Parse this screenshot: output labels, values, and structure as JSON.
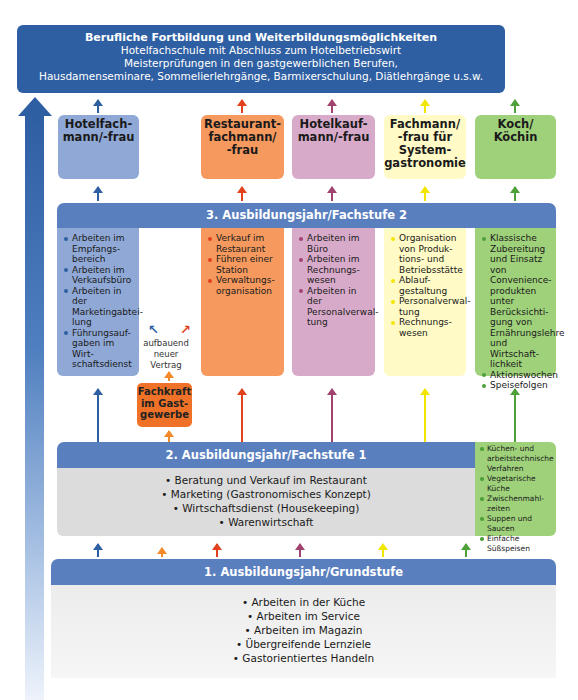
{
  "top_banner": {
    "title": "Berufliche Fortbildung und Weiterbildungsmöglichkeiten",
    "lines": [
      "Hotelfachschule mit Abschluss zum Hotelbetriebswirt",
      "Meisterprüfungen in den gastgewerblichen Berufen,",
      "Hausdamenseminare, Sommelierlehrgänge, Barmixerschulung, Diätlehrgänge u.s.w."
    ]
  },
  "colors": {
    "hotelfach": "#8fa8d6",
    "hotelfach_arrow": "#2f5fa3",
    "restaurant": "#f5995e",
    "restaurant_arrow": "#e2421b",
    "hotelkauf": "#d8aac9",
    "hotelkauf_arrow": "#a0446f",
    "system": "#fffac6",
    "system_arrow": "#f2e600",
    "koch": "#9fd17a",
    "koch_arrow": "#4ea03a",
    "fachkraft": "#f07228",
    "fachkraft_arrow": "#f28a2a",
    "header_blue": "#5a7fbf",
    "banner_blue": "#2f5fa3"
  },
  "jobs": [
    {
      "label_lines": [
        "Hotelfach-",
        "mann/-frau"
      ]
    },
    {
      "label_lines": [
        "Restaurant-",
        "fachmann/",
        "-frau"
      ]
    },
    {
      "label_lines": [
        "Hotelkauf-",
        "mann/-frau"
      ]
    },
    {
      "label_lines": [
        "Fachmann/",
        "-frau für",
        "System-",
        "gastronomie"
      ]
    },
    {
      "label_lines": [
        "Koch/",
        "Köchin"
      ]
    }
  ],
  "stage3": {
    "title": "3. Ausbildungsjahr/Fachstufe 2",
    "columns": [
      {
        "items": [
          "Arbeiten im Empfangs-bereich",
          "Arbeiten im Verkaufsbüro",
          "Arbeiten in der Marketingabtei-lung",
          "Führungsauf-gaben im Wirt-schaftsdienst"
        ]
      },
      {
        "items": [
          "Verkauf im Restaurant",
          "Führen einer Station",
          "Verwaltungs-organisation"
        ]
      },
      {
        "items": [
          "Arbeiten im Büro",
          "Arbeiten im Rechnungs-wesen",
          "Arbeiten in der Personalverwal-tung"
        ]
      },
      {
        "items": [
          "Organisation von Produk-tions- und Betriebsstätte",
          "Ablauf-gestaltung",
          "Personalverwal-tung",
          "Rechnungs-wesen"
        ]
      },
      {
        "items": [
          "Klassische Zubereitung und Einsatz von Convenience-produkten unter Berücksichti-gung von Ernährungslehre und Wirtschaft-lichkeit",
          "Aktionswochen",
          "Speisefolgen"
        ]
      }
    ]
  },
  "aufbauend": {
    "lines": [
      "aufbauend",
      "neuer",
      "Vertrag"
    ]
  },
  "fachkraft": {
    "label_lines": [
      "Fachkraft",
      "im Gast-",
      "gewerbe"
    ]
  },
  "stage2": {
    "title": "2. Ausbildungsjahr/Fachstufe 1",
    "items": [
      "• Beratung und Verkauf im Restaurant",
      "• Marketing (Gastronomisches Konzept)",
      "• Wirtschaftsdienst (Housekeeping)",
      "• Warenwirtschaft"
    ],
    "koch_items": [
      "Küchen- und arbeitstechnische Verfahren",
      "Vegetarische Küche",
      "Zwischenmahl-zeiten",
      "Suppen und Saucen",
      "Einfache Süßspeisen"
    ]
  },
  "stage1": {
    "title": "1. Ausbildungsjahr/Grundstufe",
    "items": [
      "• Arbeiten in der Küche",
      "• Arbeiten im Service",
      "• Arbeiten im Magazin",
      "• Übergreifende Lernziele",
      "• Gastorientiertes Handeln"
    ]
  }
}
